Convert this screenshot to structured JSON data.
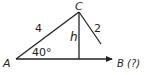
{
  "diagram": {
    "type": "triangle-ambiguous-case",
    "vertices": {
      "A": {
        "label": "A"
      },
      "B": {
        "label": "B (?)"
      },
      "C": {
        "label": "C"
      }
    },
    "sides": {
      "AC": {
        "label": "4"
      },
      "CB": {
        "label": "2"
      },
      "height": {
        "label": "h"
      }
    },
    "angle_A": {
      "label": "40°"
    },
    "colors": {
      "stroke": "#222222",
      "background": "#ffffff"
    }
  }
}
